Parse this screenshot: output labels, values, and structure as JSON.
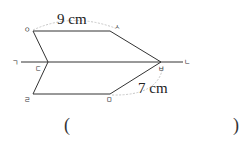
{
  "figure": {
    "labels": {
      "o": "ㅇ",
      "s": "ㅅ",
      "g": "ㄱ",
      "n": "ㄴ",
      "d": "ㄷ",
      "b": "ㅂ",
      "r": "ㄹ",
      "m": "ㅁ"
    },
    "measurements": {
      "top": "9 cm",
      "bottom_right": "7 cm"
    },
    "colors": {
      "line": "#333333",
      "arc": "#c8c8c8"
    }
  },
  "answer": {
    "open_paren": "(",
    "close_paren": ")",
    "value": ""
  }
}
